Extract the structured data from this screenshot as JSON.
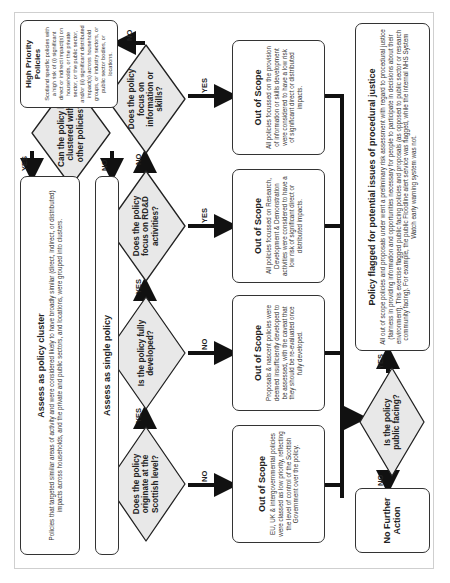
{
  "diagram": {
    "type": "flowchart",
    "orientation": "rotated-90-counterclockwise",
    "decisions": {
      "scottish_level": "Does the policy originate at the Scottish level?",
      "fully_developed": "Is the policy fully developed?",
      "rdd": "Does the policy focus on RD&D activities?",
      "info_skills": "Does the policy focus on information or skills?",
      "clustered": "Can the policy be clustered with other policies?",
      "public_facing": "Is the policy public facing?"
    },
    "boxes": {
      "oos_eu": {
        "title": "Out of Scope",
        "desc": "EU, UK & intergovernmental policies were classed as low priority, reflecting the level of control of the Scottish Government over the policy."
      },
      "oos_nascent": {
        "title": "Out of Scope",
        "desc": "Proposals & nascent policies were deemed insufficiently developed to be assessed, with the caveat that they should be re-evaluated once fully developed."
      },
      "oos_rdd": {
        "title": "Out of Scope",
        "desc": "All policies focussed on Research, Development & Demonstration activities were considered to have a low risk of significant direct or distributed impacts."
      },
      "oos_info": {
        "title": "Out of Scope",
        "desc": "All policies focussed on the provision of information or skills development were considered to have a low risk of significant direct or distributed impacts."
      },
      "high_priority": {
        "title": "High Priority Policies",
        "desc": "Scotland specific policies with a high risk of (i) significant direct or indirect impact(s) on households, or the private sector, or the public sector, and/or (ii) significant distributed impact(s) across household groups, or industry sectors, or public sector bodies, or locations."
      },
      "cluster": {
        "title": "Assess as policy cluster",
        "desc": "Policies that targeted similar areas of activity and were considered likely to have broadly similar (direct, indirect, or distributed) impacts across households, and the private and public sectors, and locations, were grouped into clusters."
      },
      "single": {
        "title": "Assess as single policy"
      },
      "flagged": {
        "title": "Policy flagged for potential issues of procedural justice",
        "desc": "All out of scope policies and proposals under went a preliminary risk assessment with regard to procedural justice (fairness in providing information and opportunities necessary for people to participate in decisions about their environment). This exercise flagged public facing policies and proposals (as opposed to public sector or research community facing). For example, the public Floodline alert service was flagged, while the internal NHS System Watch early warning system was not."
      },
      "no_action": {
        "title": "No Further Action"
      }
    },
    "labels": {
      "yes": "YES",
      "no": "NO"
    },
    "colors": {
      "diamond_fill": "#e8e8e8",
      "stroke": "#222222",
      "arrow": "#111111"
    }
  }
}
